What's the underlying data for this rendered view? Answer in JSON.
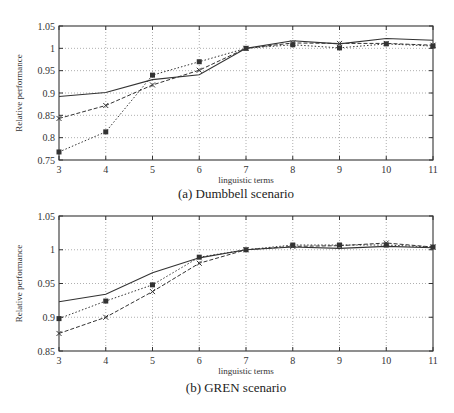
{
  "chart_data": [
    {
      "type": "line",
      "title": "",
      "caption": "(a) Dumbbell scenario",
      "xlabel": "linguistic terms",
      "ylabel": "Relative performance",
      "x": [
        3,
        4,
        5,
        6,
        7,
        8,
        9,
        10,
        11
      ],
      "xlim": [
        3,
        11
      ],
      "ylim": [
        0.75,
        1.05
      ],
      "xticks": [
        "3",
        "4",
        "5",
        "6",
        "7",
        "8",
        "9",
        "10",
        "11"
      ],
      "yticks": [
        "0.75",
        "0.8",
        "0.85",
        "0.9",
        "0.95",
        "1",
        "1.05"
      ],
      "ytick_values": [
        0.75,
        0.8,
        0.85,
        0.9,
        0.95,
        1.0,
        1.05
      ],
      "grid": true,
      "legend": "none",
      "series": [
        {
          "name": "solid",
          "style": "solid",
          "marker": "none",
          "values": [
            0.892,
            0.901,
            0.93,
            0.941,
            1.0,
            1.017,
            1.01,
            1.022,
            1.018
          ]
        },
        {
          "name": "dashed-cross",
          "style": "dashed",
          "marker": "cross",
          "values": [
            0.843,
            0.872,
            0.918,
            0.951,
            1.0,
            1.012,
            1.011,
            1.011,
            1.007
          ]
        },
        {
          "name": "dotted-square",
          "style": "dotted",
          "marker": "square",
          "values": [
            0.768,
            0.813,
            0.94,
            0.97,
            1.0,
            1.008,
            1.001,
            1.01,
            1.005
          ]
        }
      ]
    },
    {
      "type": "line",
      "title": "",
      "caption": "(b) GREN scenario",
      "xlabel": "linguistic terms",
      "ylabel": "Relative performance",
      "x": [
        3,
        4,
        5,
        6,
        7,
        8,
        9,
        10,
        11
      ],
      "xlim": [
        3,
        11
      ],
      "ylim": [
        0.85,
        1.05
      ],
      "xticks": [
        "3",
        "4",
        "5",
        "6",
        "7",
        "8",
        "9",
        "10",
        "11"
      ],
      "yticks": [
        "0.85",
        "0.9",
        "0.95",
        "1",
        "1.05"
      ],
      "ytick_values": [
        0.85,
        0.9,
        0.95,
        1.0,
        1.05
      ],
      "grid": true,
      "legend": "none",
      "series": [
        {
          "name": "solid",
          "style": "solid",
          "marker": "none",
          "values": [
            0.923,
            0.934,
            0.966,
            0.988,
            1.0,
            1.004,
            1.002,
            1.005,
            1.003
          ]
        },
        {
          "name": "dotted-square",
          "style": "dotted",
          "marker": "square",
          "values": [
            0.898,
            0.924,
            0.948,
            0.989,
            1.0,
            1.007,
            1.007,
            1.007,
            1.004
          ]
        },
        {
          "name": "dashed-cross",
          "style": "dashed",
          "marker": "cross",
          "values": [
            0.876,
            0.9,
            0.938,
            0.98,
            1.0,
            1.005,
            1.006,
            1.01,
            1.004
          ]
        }
      ]
    }
  ]
}
